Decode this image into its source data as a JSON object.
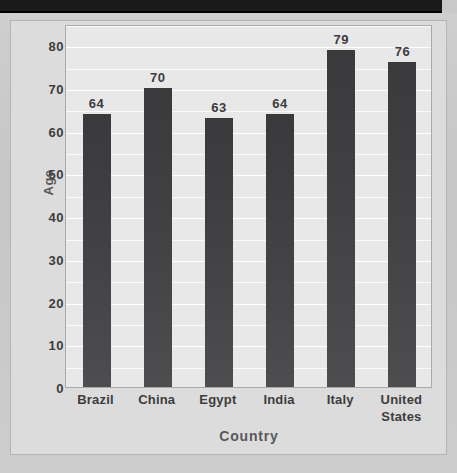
{
  "page": {
    "background_color": "#c9c9c9",
    "top_band_color": "#1a1a1a"
  },
  "chart_data": {
    "type": "bar",
    "title": "",
    "xlabel": "Country",
    "ylabel": "Age",
    "categories": [
      "Brazil",
      "China",
      "Egypt",
      "India",
      "Italy",
      "United States"
    ],
    "values": [
      64,
      70,
      63,
      64,
      79,
      76
    ],
    "value_labels": [
      "64",
      "70",
      "63",
      "64",
      "79",
      "76"
    ],
    "ylim": [
      0,
      85
    ],
    "yticks": [
      0,
      10,
      20,
      30,
      40,
      50,
      60,
      70,
      80
    ],
    "ytick_labels": [
      "0",
      "10",
      "20",
      "30",
      "40",
      "50",
      "60",
      "70",
      "80"
    ],
    "minor_gridline_step": 5,
    "grid": true,
    "legend": false,
    "bar_color": "#414143",
    "plot_background": "#e8e8e8",
    "gridline_color": "#ffffff",
    "text_color": "#3c3c3e",
    "axis_title_color": "#58585a"
  }
}
